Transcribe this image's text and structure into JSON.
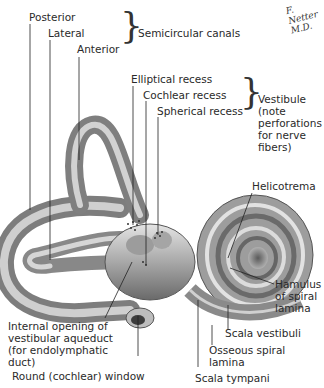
{
  "figure": {
    "signature": "F. Netter M.D.",
    "group_labels": {
      "semicircular_canals": "Semicircular canals",
      "vestibule": [
        "Vestibule",
        "(note",
        "perforations",
        "for nerve",
        "fibers)"
      ]
    },
    "canal_labels": [
      "Posterior",
      "Lateral",
      "Anterior"
    ],
    "recess_labels": [
      "Elliptical recess",
      "Cochlear recess",
      "Spherical recess"
    ],
    "right_labels": {
      "helicotrema": "Helicotrema",
      "hamulus": [
        "Hamulus",
        "of spiral",
        "lamina"
      ],
      "scala_vestibuli": "Scala vestibuli",
      "osseous_spiral_lamina": [
        "Osseous spiral",
        "lamina"
      ],
      "scala_tympani": "Scala tympani"
    },
    "left_labels": {
      "vestibular_aqueduct": [
        "Internal opening of",
        "vestibular aqueduct",
        "(for endolymphatic",
        "duct)"
      ],
      "round_window": "Round (cochlear) window"
    },
    "colors": {
      "bone_light": "#d9d9d9",
      "bone_mid": "#9a9a9a",
      "bone_dark": "#555555",
      "leader": "#222222"
    }
  }
}
